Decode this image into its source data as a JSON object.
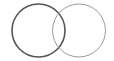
{
  "diagram": {
    "type": "venn",
    "sets": [
      {
        "name": "circle-a",
        "cx": 38.5,
        "cy": 30.5,
        "r": 26.5,
        "stroke": "#555555",
        "stroke_width": 1.6
      },
      {
        "name": "circle-b",
        "cx": 79,
        "cy": 30.5,
        "r": 26.5,
        "stroke": "#9a9a9a",
        "stroke_width": 1.0
      }
    ],
    "labels": []
  }
}
